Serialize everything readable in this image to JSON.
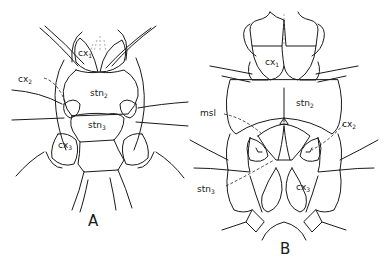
{
  "figure": {
    "panels": [
      {
        "id": "A",
        "label": "A",
        "structures": [
          {
            "base": "cx",
            "sub": "1"
          },
          {
            "base": "stn",
            "sub": "2"
          },
          {
            "base": "cx",
            "sub": "2"
          },
          {
            "base": "stn",
            "sub": "3"
          },
          {
            "base": "cx",
            "sub": "3"
          }
        ]
      },
      {
        "id": "B",
        "label": "B",
        "structures": [
          {
            "base": "cx",
            "sub": "1"
          },
          {
            "base": "stn",
            "sub": "2"
          },
          {
            "base": "msl",
            "sub": ""
          },
          {
            "base": "cx",
            "sub": "2"
          },
          {
            "base": "stn",
            "sub": "3"
          },
          {
            "base": "cx",
            "sub": "3"
          }
        ]
      }
    ]
  }
}
